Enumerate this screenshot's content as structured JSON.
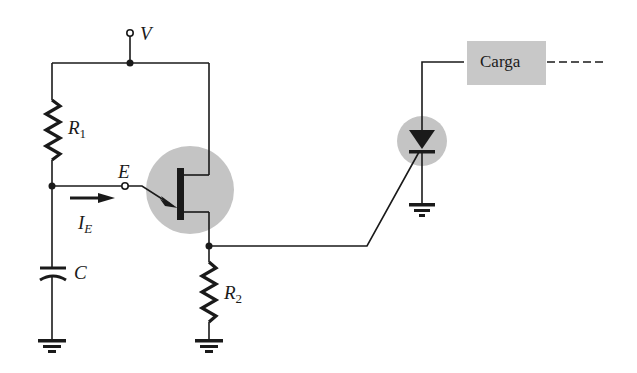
{
  "diagram": {
    "type": "circuit-schematic",
    "colors": {
      "wire": "#1a1a1a",
      "highlight": "#c4c4c4",
      "load_box": "#c8c8c8"
    },
    "labels": {
      "supply": "V",
      "r1_main": "R",
      "r1_sub": "1",
      "r2_main": "R",
      "r2_sub": "2",
      "emitter": "E",
      "current_main": "I",
      "current_sub": "E",
      "capacitor": "C",
      "load": "Carga"
    },
    "components": [
      {
        "id": "V",
        "kind": "supply-terminal"
      },
      {
        "id": "R1",
        "kind": "resistor"
      },
      {
        "id": "C",
        "kind": "capacitor"
      },
      {
        "id": "UJT",
        "kind": "unijunction-transistor",
        "highlighted": true
      },
      {
        "id": "R2",
        "kind": "resistor"
      },
      {
        "id": "SCR",
        "kind": "thyristor",
        "highlighted": true
      },
      {
        "id": "Carga",
        "kind": "load-box"
      },
      {
        "id": "GND1",
        "kind": "ground"
      },
      {
        "id": "GND2",
        "kind": "ground"
      },
      {
        "id": "GND3",
        "kind": "ground"
      }
    ]
  }
}
